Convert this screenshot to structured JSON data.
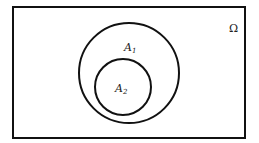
{
  "diagram": {
    "type": "venn",
    "universe": {
      "label": "Ω",
      "x": 13,
      "y": 7,
      "width": 232,
      "height": 131
    },
    "sets": [
      {
        "name": "A",
        "subscript": "1",
        "cx": 129,
        "cy": 73,
        "r": 50,
        "label_x": 125,
        "label_y": 51
      },
      {
        "name": "A",
        "subscript": "2",
        "cx": 123,
        "cy": 87,
        "r": 28,
        "label_x": 116,
        "label_y": 93
      }
    ],
    "relation": "A2 ⊂ A1 ⊂ Ω",
    "stroke_color": "#111111",
    "background": "#ffffff"
  }
}
